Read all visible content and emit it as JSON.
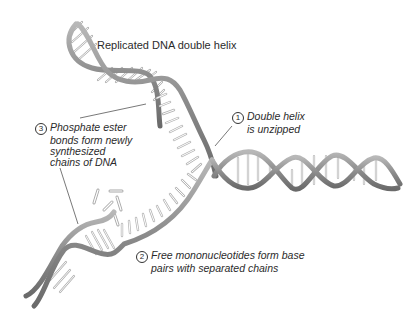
{
  "title_label": "Replicated DNA double helix",
  "steps": [
    {
      "number": "1",
      "lines": [
        "Double helix",
        "is unzipped"
      ]
    },
    {
      "number": "2",
      "lines": [
        "Free mononucleotides form base",
        "pairs with separated chains"
      ]
    },
    {
      "number": "3",
      "lines": [
        "Phosphate ester",
        "bonds form newly",
        "synthesized",
        "chains of DNA"
      ]
    }
  ],
  "colors": {
    "backbone": "#8a8a8a",
    "backbone_light": "#c4c4c4",
    "backbone_dark": "#5e5e5e",
    "base": "#b5b5b5",
    "leader": "#555555",
    "text": "#2b2b2b"
  }
}
